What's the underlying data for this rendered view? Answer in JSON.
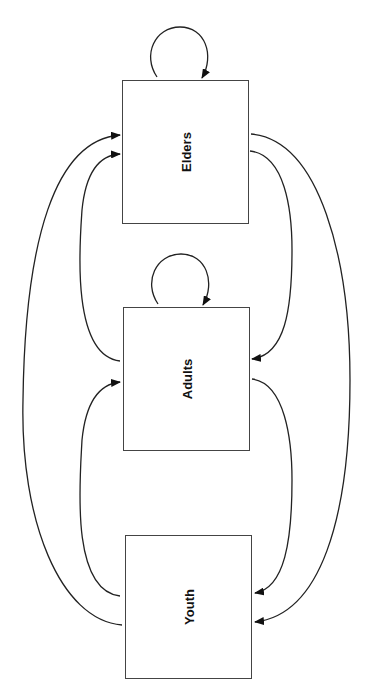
{
  "diagram": {
    "nodes": [
      {
        "id": "elders",
        "label": "Elders"
      },
      {
        "id": "adults",
        "label": "Adults"
      },
      {
        "id": "youth",
        "label": "Youth"
      }
    ],
    "edges": [
      {
        "from": "elders",
        "to": "elders",
        "type": "self-loop"
      },
      {
        "from": "adults",
        "to": "adults",
        "type": "self-loop"
      },
      {
        "from": "adults",
        "to": "elders"
      },
      {
        "from": "youth",
        "to": "elders"
      },
      {
        "from": "youth",
        "to": "adults"
      },
      {
        "from": "elders",
        "to": "adults"
      },
      {
        "from": "elders",
        "to": "youth"
      },
      {
        "from": "adults",
        "to": "youth"
      }
    ],
    "colors": {
      "line": "#222222",
      "box_border": "#444444"
    }
  }
}
